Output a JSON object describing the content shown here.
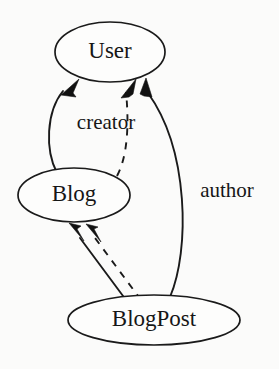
{
  "diagram": {
    "type": "directed-graph",
    "background_color": "#fbfbfa",
    "stroke_color": "#1a1a1a",
    "nodes": [
      {
        "id": "user",
        "label": "User",
        "shape": "ellipse",
        "cx": 110,
        "cy": 52,
        "rx": 55,
        "ry": 30
      },
      {
        "id": "blog",
        "label": "Blog",
        "shape": "ellipse",
        "cx": 74,
        "cy": 195,
        "rx": 56,
        "ry": 27
      },
      {
        "id": "blogpost",
        "label": "BlogPost",
        "shape": "ellipse",
        "cx": 154,
        "cy": 320,
        "rx": 86,
        "ry": 25
      }
    ],
    "edges": [
      {
        "id": "blog-creator-user",
        "from": "blog",
        "to": "user",
        "label": "creator",
        "style": "solid",
        "arrow": "filled"
      },
      {
        "id": "blogpost-author-user",
        "from": "blogpost",
        "to": "user",
        "label": "author",
        "style": "solid",
        "arrow": "filled"
      },
      {
        "id": "blogpost-blog",
        "from": "blogpost",
        "to": "blog",
        "label": "",
        "style": "solid",
        "arrow": "filled"
      },
      {
        "id": "blog-user-dashed",
        "from": "blog",
        "to": "user",
        "label": "",
        "style": "dashed",
        "arrow": "filled"
      },
      {
        "id": "blogpost-blog-dashed",
        "from": "blogpost",
        "to": "blog",
        "label": "",
        "style": "dashed",
        "arrow": "filled"
      }
    ],
    "edge_labels": [
      {
        "id": "creator",
        "text": "creator",
        "x": 106,
        "y": 124
      },
      {
        "id": "author",
        "text": "author",
        "x": 227,
        "y": 192
      }
    ]
  }
}
